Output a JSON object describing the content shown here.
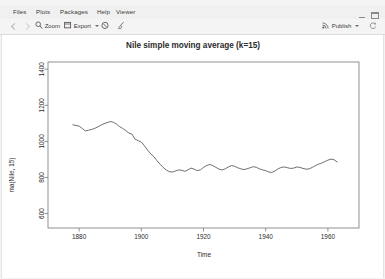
{
  "window": {
    "minimize_icon": "minimize-icon",
    "maximize_icon": "maximize-icon"
  },
  "tabs": [
    {
      "label": "Files",
      "active": false
    },
    {
      "label": "Plots",
      "active": true
    },
    {
      "label": "Packages",
      "active": false
    },
    {
      "label": "Help",
      "active": false
    },
    {
      "label": "Viewer",
      "active": false
    }
  ],
  "toolbar": {
    "back_icon": "back-arrow-icon",
    "forward_icon": "forward-arrow-icon",
    "zoom_label": "Zoom",
    "zoom_icon": "magnifier-icon",
    "export_label": "Export",
    "export_icon": "export-icon",
    "remove_icon": "remove-plot-icon",
    "clear_all_icon": "broom-clear-icon",
    "publish_label": "Publish",
    "publish_icon": "publish-icon",
    "refresh_icon": "refresh-icon"
  },
  "chart_data": {
    "type": "line",
    "title": "Nile simple moving average (k=15)",
    "xlabel": "Time",
    "ylabel": "ma(Nile, 15)",
    "xlim": [
      1870,
      1970
    ],
    "ylim": [
      520,
      1440
    ],
    "xticks": [
      1880,
      1900,
      1920,
      1940,
      1960
    ],
    "yticks": [
      600,
      800,
      1000,
      1200,
      1400
    ],
    "grid": false,
    "legend": false,
    "line_color": "#555555",
    "series": [
      {
        "name": "ma(Nile, 15)",
        "x": [
          1878,
          1879,
          1880,
          1881,
          1882,
          1883,
          1884,
          1885,
          1886,
          1887,
          1888,
          1889,
          1890,
          1891,
          1892,
          1893,
          1894,
          1895,
          1896,
          1897,
          1898,
          1899,
          1900,
          1901,
          1902,
          1903,
          1904,
          1905,
          1906,
          1907,
          1908,
          1909,
          1910,
          1911,
          1912,
          1913,
          1914,
          1915,
          1916,
          1917,
          1918,
          1919,
          1920,
          1921,
          1922,
          1923,
          1924,
          1925,
          1926,
          1927,
          1928,
          1929,
          1930,
          1931,
          1932,
          1933,
          1934,
          1935,
          1936,
          1937,
          1938,
          1939,
          1940,
          1941,
          1942,
          1943,
          1944,
          1945,
          1946,
          1947,
          1948,
          1949,
          1950,
          1951,
          1952,
          1953,
          1954,
          1955,
          1956,
          1957,
          1958,
          1959,
          1960,
          1961,
          1962,
          1963
        ],
        "y": [
          1092,
          1088,
          1085,
          1072,
          1058,
          1062,
          1066,
          1072,
          1080,
          1090,
          1098,
          1104,
          1110,
          1106,
          1096,
          1082,
          1072,
          1060,
          1046,
          1040,
          1012,
          1004,
          996,
          976,
          952,
          932,
          916,
          894,
          874,
          856,
          842,
          832,
          830,
          836,
          842,
          840,
          834,
          842,
          852,
          846,
          838,
          842,
          856,
          866,
          872,
          866,
          856,
          846,
          842,
          848,
          858,
          866,
          862,
          854,
          848,
          844,
          848,
          854,
          860,
          856,
          848,
          842,
          838,
          830,
          828,
          836,
          848,
          856,
          858,
          854,
          850,
          852,
          858,
          856,
          850,
          846,
          848,
          856,
          866,
          874,
          880,
          888,
          896,
          902,
          898,
          886
        ]
      }
    ]
  }
}
